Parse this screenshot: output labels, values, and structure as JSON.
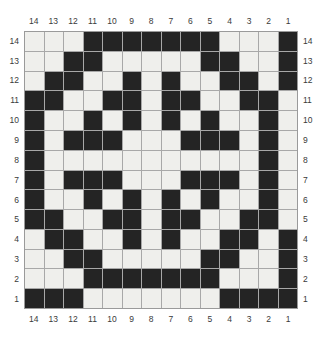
{
  "chart_data": {
    "type": "heatmap",
    "title": "",
    "xlabel": "",
    "ylabel": "",
    "rows": 14,
    "cols": 14,
    "grid_on": true,
    "legend_position": "none",
    "colors": {
      "light_cell": "#efefec",
      "dark_cell": "#242424",
      "gridline": "#a8a8a8",
      "border": "#9a9a9a",
      "background": "#ffffff",
      "label_text": "#3a3a3a"
    },
    "value_legend": {
      "0": "light",
      "1": "dark"
    },
    "x_tick_labels": [
      "14",
      "13",
      "12",
      "11",
      "10",
      "9",
      "8",
      "7",
      "6",
      "5",
      "4",
      "3",
      "2",
      "1"
    ],
    "y_tick_labels": [
      "14",
      "13",
      "12",
      "11",
      "10",
      "9",
      "8",
      "7",
      "6",
      "5",
      "4",
      "3",
      "2",
      "1"
    ],
    "values": [
      [
        0,
        0,
        0,
        1,
        1,
        1,
        1,
        1,
        1,
        1,
        0,
        0,
        0,
        1
      ],
      [
        0,
        0,
        1,
        1,
        0,
        0,
        0,
        0,
        0,
        1,
        1,
        0,
        0,
        1
      ],
      [
        0,
        1,
        1,
        0,
        0,
        1,
        0,
        1,
        0,
        0,
        1,
        1,
        0,
        1
      ],
      [
        1,
        1,
        0,
        0,
        1,
        1,
        0,
        1,
        1,
        0,
        0,
        1,
        1,
        0
      ],
      [
        1,
        0,
        0,
        1,
        0,
        1,
        0,
        1,
        0,
        1,
        0,
        0,
        1,
        0
      ],
      [
        1,
        0,
        1,
        1,
        1,
        0,
        0,
        0,
        1,
        1,
        1,
        0,
        1,
        0
      ],
      [
        1,
        0,
        0,
        0,
        0,
        0,
        0,
        0,
        0,
        0,
        0,
        0,
        1,
        0
      ],
      [
        1,
        0,
        1,
        1,
        1,
        0,
        0,
        0,
        1,
        1,
        1,
        0,
        1,
        0
      ],
      [
        1,
        0,
        0,
        1,
        0,
        1,
        0,
        1,
        0,
        1,
        0,
        0,
        1,
        0
      ],
      [
        1,
        1,
        0,
        0,
        1,
        1,
        0,
        1,
        1,
        0,
        0,
        1,
        1,
        0
      ],
      [
        0,
        1,
        1,
        0,
        0,
        1,
        0,
        1,
        0,
        0,
        1,
        1,
        0,
        1
      ],
      [
        0,
        0,
        1,
        1,
        0,
        0,
        0,
        0,
        0,
        1,
        1,
        0,
        0,
        1
      ],
      [
        0,
        0,
        0,
        1,
        1,
        1,
        1,
        1,
        1,
        1,
        0,
        0,
        0,
        1
      ],
      [
        1,
        1,
        1,
        0,
        0,
        0,
        0,
        0,
        0,
        0,
        1,
        1,
        1,
        1
      ]
    ]
  },
  "axes": {
    "top": {
      "name": "top-axis",
      "ticks": [
        "14",
        "13",
        "12",
        "11",
        "10",
        "9",
        "8",
        "7",
        "6",
        "5",
        "4",
        "3",
        "2",
        "1"
      ]
    },
    "bottom": {
      "name": "bottom-axis",
      "ticks": [
        "14",
        "13",
        "12",
        "11",
        "10",
        "9",
        "8",
        "7",
        "6",
        "5",
        "4",
        "3",
        "2",
        "1"
      ]
    },
    "left": {
      "name": "left-axis",
      "ticks": [
        "14",
        "13",
        "12",
        "11",
        "10",
        "9",
        "8",
        "7",
        "6",
        "5",
        "4",
        "3",
        "2",
        "1"
      ]
    },
    "right": {
      "name": "right-axis",
      "ticks": [
        "14",
        "13",
        "12",
        "11",
        "10",
        "9",
        "8",
        "7",
        "6",
        "5",
        "4",
        "3",
        "2",
        "1"
      ]
    }
  }
}
